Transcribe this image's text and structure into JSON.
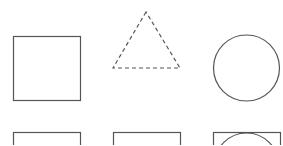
{
  "canvas": {
    "width": 283,
    "height": 145,
    "background": "#ffffff"
  },
  "stroke_color": "#555555",
  "stroke_width": 1.2,
  "shapes": [
    {
      "id": "square-top-left",
      "type": "rect",
      "x": 13,
      "y": 36,
      "width": 67,
      "height": 64,
      "dashed": false
    },
    {
      "id": "triangle-top-middle",
      "type": "triangle",
      "points": "146,12 113,68 180,68",
      "dashed": true
    },
    {
      "id": "circle-top-right",
      "type": "circle",
      "cx": 246,
      "cy": 68,
      "r": 33,
      "dashed": false
    },
    {
      "id": "square-bottom-left",
      "type": "rect",
      "x": 13,
      "y": 132,
      "width": 67,
      "height": 64,
      "dashed": false
    },
    {
      "id": "square-bottom-middle",
      "type": "rect",
      "x": 113,
      "y": 132,
      "width": 67,
      "height": 64,
      "dashed": false
    },
    {
      "id": "square-bottom-right",
      "type": "rect",
      "x": 213,
      "y": 132,
      "width": 67,
      "height": 64,
      "dashed": false
    },
    {
      "id": "circle-bottom-right-inscribed",
      "type": "circle",
      "cx": 246,
      "cy": 164,
      "r": 32,
      "dashed": false
    }
  ]
}
